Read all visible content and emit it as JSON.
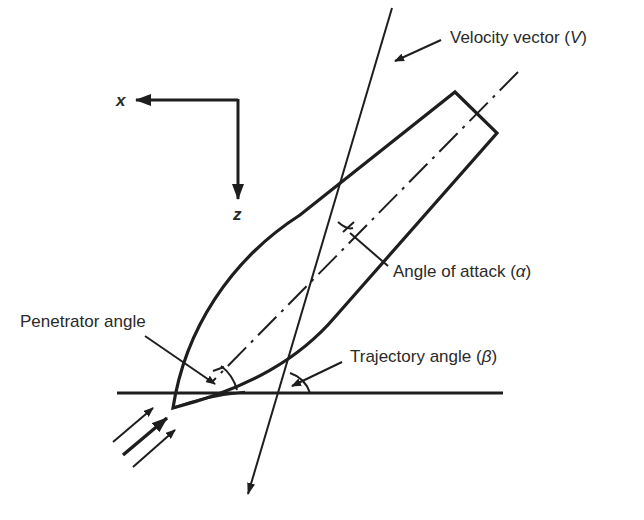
{
  "diagram": {
    "axes": {
      "x_label": "x",
      "z_label": "z"
    },
    "labels": {
      "velocity_vector": "Velocity vector (",
      "velocity_symbol": "V",
      "velocity_close": ")",
      "angle_of_attack": "Angle of attack (",
      "angle_of_attack_symbol": "α",
      "angle_of_attack_close": ")",
      "penetrator_angle": "Penetrator angle",
      "trajectory_angle": "Trajectory angle (",
      "trajectory_angle_symbol": "β",
      "trajectory_angle_close": ")"
    },
    "colors": {
      "line": "#1e1e1e",
      "text": "#2a2a2a",
      "background": "#ffffff"
    }
  }
}
